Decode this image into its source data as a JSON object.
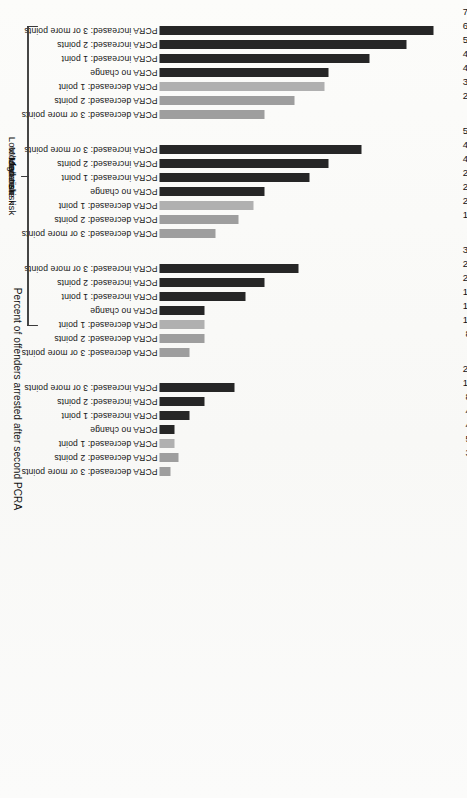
{
  "figure": {
    "axis_title": "Percent of offenders arrested after second PCRA",
    "colors": {
      "increase_bar": "#262626",
      "decrease_bar": "#b0b0b0",
      "decrease_bar_mid": "#9e9e9e",
      "background": "#fbfbf9",
      "text": "#111111"
    }
  },
  "chart_data": {
    "type": "bar",
    "title": "",
    "xlabel": "",
    "ylabel": "Percent of offenders arrested after second PCRA",
    "ylim": [
      0,
      80
    ],
    "grid": false,
    "legend": "none",
    "orientation": "vertical-bars-on-rotated-page",
    "categories": [
      "PCRA increased: 3 or more points",
      "PCRA increased: 2 points",
      "PCRA increased: 1 point",
      "PCRA no change",
      "PCRA decreased: 1 point",
      "PCRA decreased: 2 points",
      "PCRA decreased: 3 or more points"
    ],
    "groups": [
      {
        "name": "High risk",
        "values": [
          73,
          66,
          56,
          45,
          44,
          36,
          28
        ],
        "labels": [
          "73%",
          "66%",
          "56%",
          "45%",
          "44%",
          "36%",
          "28%"
        ],
        "shades": [
          "dark",
          "dark",
          "dark",
          "dark",
          "light",
          "mid",
          "mid"
        ]
      },
      {
        "name": "Moderate risk",
        "values": [
          54,
          45,
          40,
          28,
          25,
          21,
          15
        ],
        "labels": [
          "54%",
          "45%",
          "40%",
          "28%",
          "25%",
          "21%",
          "15%"
        ],
        "shades": [
          "dark",
          "dark",
          "dark",
          "dark",
          "light",
          "mid",
          "mid"
        ]
      },
      {
        "name": "Low/Moderate risk",
        "values": [
          37,
          28,
          23,
          12,
          12,
          12,
          8
        ],
        "labels": [
          "37%",
          "28%",
          "23%",
          "12%",
          "12%",
          "12%",
          "8%"
        ],
        "shades": [
          "dark",
          "dark",
          "dark",
          "dark",
          "light",
          "mid",
          "mid"
        ]
      },
      {
        "name": "Low risk",
        "values": [
          20,
          12,
          8,
          4,
          4,
          5,
          3
        ],
        "labels": [
          "20%",
          "12%",
          "8%",
          "4%",
          "4%",
          "5%",
          "3%"
        ],
        "shades": [
          "dark",
          "dark",
          "dark",
          "dark",
          "light",
          "mid",
          "mid"
        ]
      }
    ]
  }
}
